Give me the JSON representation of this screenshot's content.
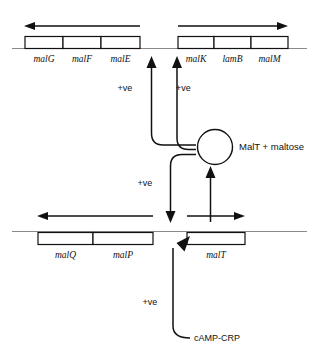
{
  "figure": {
    "colors": {
      "ink": "#111111",
      "dna": "#8a8a8a",
      "background": "#ffffff"
    }
  },
  "operons": {
    "top_left": {
      "name": "malEFG operon",
      "direction": "leftward",
      "genes": [
        {
          "label": "malG"
        },
        {
          "label": "malF"
        },
        {
          "label": "malE"
        }
      ]
    },
    "top_right": {
      "name": "malK-lamB-malM operon",
      "direction": "rightward",
      "genes": [
        {
          "label": "malK"
        },
        {
          "label": "lamB"
        },
        {
          "label": "malM"
        }
      ]
    },
    "bottom_left": {
      "name": "malPQ operon",
      "direction": "leftward",
      "genes": [
        {
          "label": "malQ"
        },
        {
          "label": "malP"
        }
      ]
    },
    "bottom_right": {
      "name": "malT gene",
      "direction": "rightward",
      "genes": [
        {
          "label": "malT"
        }
      ]
    }
  },
  "activator": {
    "label": "MalT + maltose",
    "shape": "circle"
  },
  "effector": {
    "label": "cAMP-CRP"
  },
  "regulation": [
    {
      "id": "malT-to-malE",
      "label": "+ve",
      "target": "malEFG promoter"
    },
    {
      "id": "malT-to-malK",
      "label": "+ve",
      "target": "malK promoter"
    },
    {
      "id": "malT-to-malPQ",
      "label": "+ve",
      "target": "malPQ promoter"
    },
    {
      "id": "crp-to-malT",
      "label": "+ve",
      "target": "malT promoter"
    }
  ]
}
